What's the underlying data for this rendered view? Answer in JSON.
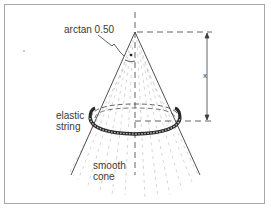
{
  "figure": {
    "type": "physics-diagram"
  },
  "labels": {
    "angle": "arctan 0.50",
    "ring_line1": "elastic",
    "ring_line2": "string",
    "cone_line1": "smooth",
    "cone_line2": "cone",
    "dimension": "x"
  },
  "colors": {
    "line": "#3c3c3c",
    "frame": "#9a9a9a",
    "background": "#ffffff",
    "text": "#3a3a3a"
  }
}
